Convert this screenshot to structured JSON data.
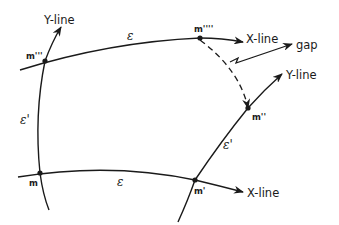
{
  "diagram": {
    "type": "curvilinear-mesh-gap",
    "labels": {
      "y_line_top_left": "Y-line",
      "x_line_top": "X-line",
      "gap": "gap",
      "y_line_right": "Y-line",
      "x_line_bottom": "X-line",
      "epsilon_top": "ε",
      "epsilon_bottom": "ε",
      "epsilon_prime_left": "ε'",
      "epsilon_prime_right": "ε'"
    },
    "points": {
      "m": "m",
      "m1": "m'",
      "m2": "m''",
      "m3": "m'''",
      "m4": "m''''"
    },
    "colors": {
      "stroke": "#1a1a1a",
      "background": "#ffffff"
    }
  }
}
